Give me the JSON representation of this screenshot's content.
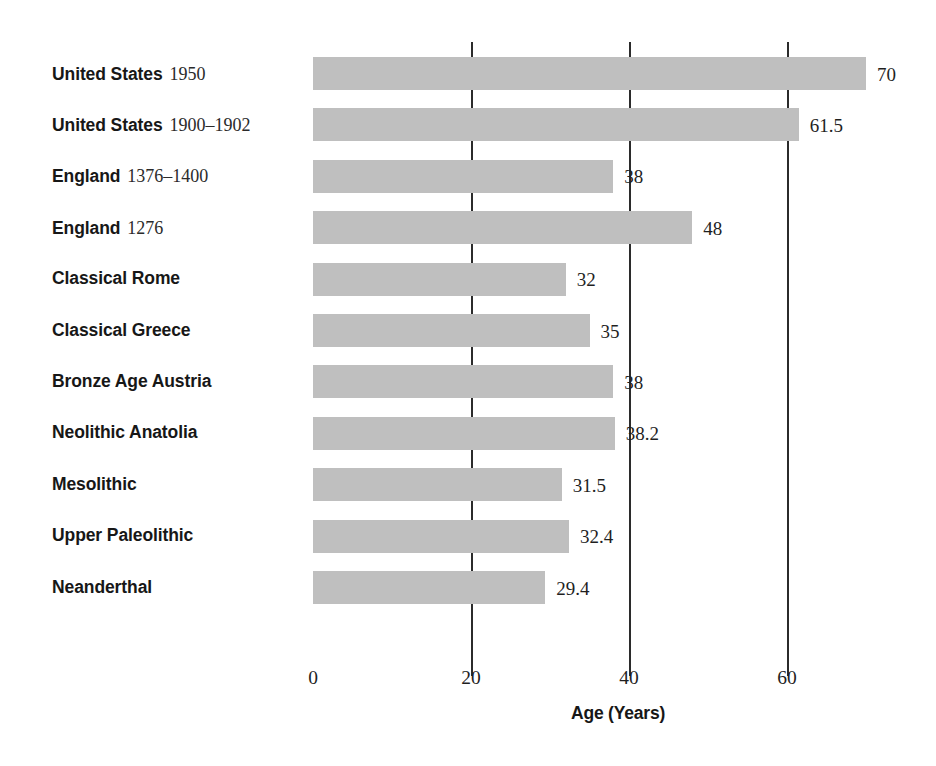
{
  "chart_data": {
    "type": "bar",
    "orientation": "horizontal",
    "title": "",
    "xlabel": "Age (Years)",
    "ylabel": "",
    "xlim": [
      0,
      74
    ],
    "xticks": [
      0,
      20,
      40,
      60
    ],
    "xticklabels": [
      "0",
      "20",
      "40",
      "60"
    ],
    "grid": "vertical gridlines at 20, 40, 60",
    "legend": "none",
    "bar_color": "#bfbfbf",
    "categories": [
      "United States 1950",
      "United States 1900–1902",
      "England 1376–1400",
      "England 1276",
      "Classical Rome",
      "Classical Greece",
      "Bronze Age Austria",
      "Neolithic Anatolia",
      "Mesolithic",
      "Upper Paleolithic",
      "Neanderthal"
    ],
    "values": [
      70,
      61.5,
      38,
      48,
      32,
      35,
      38,
      38.2,
      31.5,
      32.4,
      29.4
    ],
    "value_labels": [
      "70",
      "61.5",
      "38",
      "48",
      "32",
      "35",
      "38",
      "38.2",
      "31.5",
      "32.4",
      "29.4"
    ]
  },
  "rows": [
    {
      "place": "United States",
      "period": "1950",
      "value": 70,
      "value_label": "70"
    },
    {
      "place": "United States",
      "period": "1900–1902",
      "value": 61.5,
      "value_label": "61.5"
    },
    {
      "place": "England",
      "period": "1376–1400",
      "value": 38,
      "value_label": "38"
    },
    {
      "place": "England",
      "period": "1276",
      "value": 48,
      "value_label": "48"
    },
    {
      "place": "Classical Rome",
      "period": "",
      "value": 32,
      "value_label": "32"
    },
    {
      "place": "Classical Greece",
      "period": "",
      "value": 35,
      "value_label": "35"
    },
    {
      "place": "Bronze Age Austria",
      "period": "",
      "value": 38,
      "value_label": "38"
    },
    {
      "place": "Neolithic Anatolia",
      "period": "",
      "value": 38.2,
      "value_label": "38.2"
    },
    {
      "place": "Mesolithic",
      "period": "",
      "value": 31.5,
      "value_label": "31.5"
    },
    {
      "place": "Upper Paleolithic",
      "period": "",
      "value": 32.4,
      "value_label": "32.4"
    },
    {
      "place": "Neanderthal",
      "period": "",
      "value": 29.4,
      "value_label": "29.4"
    }
  ],
  "axis": {
    "title": "Age (Years)",
    "ticks": [
      {
        "label": "0",
        "value": 0
      },
      {
        "label": "20",
        "value": 20
      },
      {
        "label": "40",
        "value": 40
      },
      {
        "label": "60",
        "value": 60
      }
    ]
  }
}
